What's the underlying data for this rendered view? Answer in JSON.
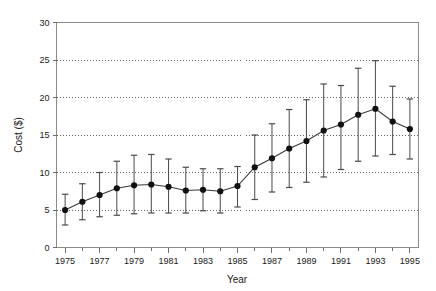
{
  "chart_data": {
    "type": "line",
    "title": "",
    "xlabel": "Year",
    "ylabel": "Cost ($)",
    "xlim": [
      1974.5,
      1995.5
    ],
    "ylim": [
      0,
      30
    ],
    "ytick_values": [
      0,
      5,
      10,
      15,
      20,
      25,
      30
    ],
    "ytick_labels": [
      "0",
      "5",
      "10",
      "15",
      "20",
      "25",
      "30"
    ],
    "xtick_values": [
      1975,
      1976,
      1977,
      1978,
      1979,
      1980,
      1981,
      1982,
      1983,
      1984,
      1985,
      1986,
      1987,
      1988,
      1989,
      1990,
      1991,
      1992,
      1993,
      1994,
      1995
    ],
    "xtick_labeled": [
      1975,
      1977,
      1979,
      1981,
      1983,
      1985,
      1987,
      1989,
      1991,
      1993,
      1995
    ],
    "xtick_labels": [
      "1975",
      "1977",
      "1979",
      "1981",
      "1983",
      "1985",
      "1987",
      "1989",
      "1991",
      "1993",
      "1995"
    ],
    "grid": "horizontal-dotted",
    "legend": "none",
    "marker": "filled-circle",
    "error_bars": "vertical-with-caps",
    "x": [
      1975,
      1976,
      1977,
      1978,
      1979,
      1980,
      1981,
      1982,
      1983,
      1984,
      1985,
      1986,
      1987,
      1988,
      1989,
      1990,
      1991,
      1992,
      1993,
      1994,
      1995
    ],
    "values": [
      5.0,
      6.1,
      7.0,
      7.9,
      8.3,
      8.4,
      8.1,
      7.6,
      7.7,
      7.5,
      8.2,
      10.7,
      11.9,
      13.2,
      14.2,
      15.6,
      16.4,
      17.7,
      18.5,
      16.8,
      15.8
    ],
    "err_upper": [
      7.1,
      8.5,
      10.0,
      11.5,
      12.3,
      12.4,
      11.8,
      10.7,
      10.5,
      10.5,
      10.8,
      15.0,
      16.5,
      18.4,
      19.7,
      21.8,
      21.6,
      23.9,
      24.9,
      21.5,
      19.8
    ],
    "err_lower": [
      3.0,
      3.7,
      4.1,
      4.3,
      4.5,
      4.6,
      4.6,
      4.6,
      4.9,
      4.6,
      5.4,
      6.4,
      7.4,
      8.0,
      8.7,
      9.4,
      10.4,
      11.5,
      12.2,
      12.4,
      11.8
    ]
  },
  "colors": {
    "background": "#ffffff",
    "line": "#3a3a3a",
    "marker": "#111111",
    "grid": "#555555",
    "frame": "#8a8a8a",
    "text": "#1a1a1a"
  }
}
